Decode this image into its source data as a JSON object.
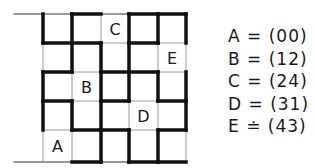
{
  "diagram": {
    "grid": {
      "rows": 5,
      "cols": 5,
      "x_lines": [
        43,
        72,
        101,
        129,
        158,
        186
      ],
      "y_lines": [
        14,
        43,
        72,
        101,
        130,
        162
      ],
      "top_rule_start_x": 14,
      "bottom_rule_start_x": 14,
      "thin_color": "#9a9a9a",
      "thick_color": "#111111",
      "thin_width": 1,
      "thick_width": 3.5,
      "vertical_thick": [
        [
          1,
          0,
          1,
          1,
          0
        ],
        [
          1,
          1,
          0,
          1,
          0
        ],
        [
          0,
          1,
          1,
          1,
          1
        ],
        [
          1,
          1,
          1,
          0,
          1
        ],
        [
          1,
          0,
          1,
          0,
          1
        ],
        [
          1,
          0,
          1,
          1,
          0
        ]
      ],
      "horizontal_thick": [
        [
          0,
          1,
          0,
          1,
          1
        ],
        [
          1,
          1,
          0,
          1,
          0
        ],
        [
          1,
          0,
          1,
          1,
          0
        ],
        [
          1,
          0,
          1,
          0,
          1
        ],
        [
          0,
          1,
          1,
          0,
          1
        ],
        [
          0,
          1,
          0,
          1,
          1
        ]
      ]
    },
    "cell_labels": [
      {
        "label": "A",
        "col": 0,
        "row": 4
      },
      {
        "label": "B",
        "col": 1,
        "row": 2
      },
      {
        "label": "C",
        "col": 2,
        "row": 0
      },
      {
        "label": "D",
        "col": 3,
        "row": 3
      },
      {
        "label": "E",
        "col": 4,
        "row": 1
      }
    ],
    "legend": [
      {
        "text": "A = (00)"
      },
      {
        "text": "B = (12)"
      },
      {
        "text": "C = (24)"
      },
      {
        "text": "D = (31)"
      },
      {
        "text": "E ≐ (43)"
      }
    ]
  }
}
